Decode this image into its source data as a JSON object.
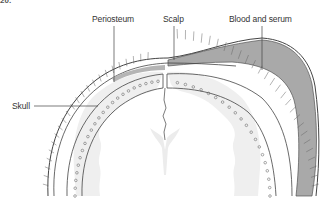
{
  "figure": {
    "id_label": "20.",
    "type": "anatomical cross-section of head",
    "labels": {
      "periosteum": "Periosteum",
      "scalp": "Scalp",
      "blood": "Blood and serum",
      "skull": "Skull"
    }
  },
  "colors": {
    "blood_fill": "#a9a9a9",
    "brain_fill": "#efefef",
    "line": "#444444",
    "label_text": "#333333",
    "background": "#ffffff"
  }
}
